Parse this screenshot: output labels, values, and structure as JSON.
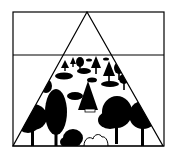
{
  "illustration": {
    "description": "Forest pyramid diagram",
    "colors": {
      "background": "#ffffff",
      "ink": "#000000"
    },
    "frame": {
      "x": 13,
      "y": 12,
      "width": 151,
      "height": 134
    },
    "divider_y": 55,
    "triangle": {
      "apex": [
        87,
        12
      ],
      "base_left": [
        13,
        146
      ],
      "base_right": [
        163,
        146
      ]
    }
  }
}
